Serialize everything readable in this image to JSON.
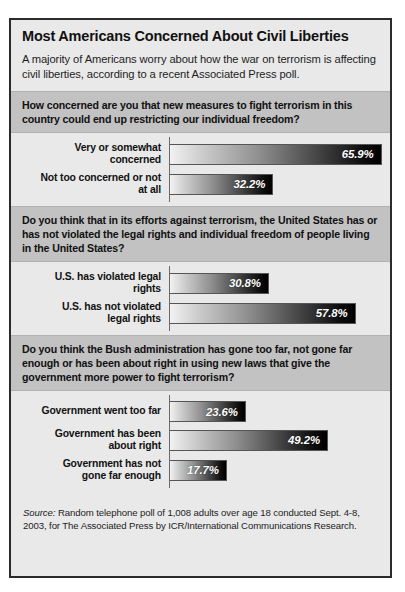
{
  "header": {
    "title": "Most Americans Concerned About Civil Liberties",
    "subtitle": "A majority of Americans worry about how the war on terrorism is affecting civil liberties, according to a recent Associated Press poll."
  },
  "sections": [
    {
      "question": "How concerned are you that new measures to fight terrorism in this country could end up restricting our individual freedom?",
      "rows": [
        {
          "label_line1": "Very or somewhat",
          "label_line2": "concerned",
          "value": 65.9,
          "value_label": "65.9%"
        },
        {
          "label_line1": "Not too concerned or not",
          "label_line2": "at all",
          "value": 32.2,
          "value_label": "32.2%"
        }
      ]
    },
    {
      "question": "Do you think that in its efforts against terrorism, the United States has or has not violated the legal rights and individual freedom of people living in the United States?",
      "rows": [
        {
          "label_line1": "U.S. has violated legal",
          "label_line2": "rights",
          "value": 30.8,
          "value_label": "30.8%"
        },
        {
          "label_line1": "U.S. has not violated",
          "label_line2": "legal rights",
          "value": 57.8,
          "value_label": "57.8%"
        }
      ]
    },
    {
      "question": "Do you think the Bush administration has gone too far, not gone far enough or has been about right in using new laws that give the government more power to fight terrorism?",
      "rows": [
        {
          "label_line1": "Government went too far",
          "label_line2": "",
          "value": 23.6,
          "value_label": "23.6%"
        },
        {
          "label_line1": "Government has been",
          "label_line2": "about right",
          "value": 49.2,
          "value_label": "49.2%"
        },
        {
          "label_line1": "Government has not",
          "label_line2": "gone far enough",
          "value": 17.7,
          "value_label": "17.7%"
        }
      ]
    }
  ],
  "source": {
    "prefix": "Source:",
    "text": " Random telephone poll of 1,008 adults over age 18 conducted Sept. 4-8, 2003, for The Associated Press by ICR/International Communications Research."
  },
  "chart_data": {
    "type": "bar",
    "title": "Most Americans Concerned About Civil Liberties",
    "subtitle": "A majority of Americans worry about how the war on terrorism is affecting civil liberties, according to a recent Associated Press poll.",
    "orientation": "horizontal",
    "xlabel": "",
    "ylabel": "",
    "xlim": [
      0,
      100
    ],
    "grid": false,
    "legend": "none",
    "units": "percent",
    "panels": [
      {
        "question": "How concerned are you that new measures to fight terrorism in this country could end up restricting our individual freedom?",
        "categories": [
          "Very or somewhat concerned",
          "Not too concerned or not at all"
        ],
        "values": [
          65.9,
          32.2
        ]
      },
      {
        "question": "Do you think that in its efforts against terrorism, the United States has or has not violated the legal rights and individual freedom of people living in the United States?",
        "categories": [
          "U.S. has violated legal rights",
          "U.S. has not violated legal rights"
        ],
        "values": [
          30.8,
          57.8
        ]
      },
      {
        "question": "Do you think the Bush administration has gone too far, not gone far enough or has been about right in using new laws that give the government more power to fight terrorism?",
        "categories": [
          "Government went too far",
          "Government has been about right",
          "Government has not gone far enough"
        ],
        "values": [
          23.6,
          49.2,
          17.7
        ]
      }
    ],
    "source": "Source: Random telephone poll of 1,008 adults over age 18 conducted Sept. 4-8, 2003, for The Associated Press by ICR/International Communications Research."
  }
}
